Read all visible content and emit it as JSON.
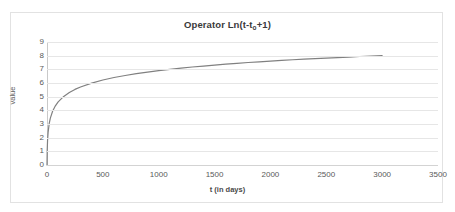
{
  "chart_data": {
    "type": "line",
    "title": "Operator  Ln(t-t",
    "title_sub": "o",
    "title_tail": "+1)",
    "title_full": "Operator  Ln(t-to+1)",
    "xlabel": "t (in days)",
    "ylabel": "value",
    "xlim": [
      0,
      3500
    ],
    "ylim": [
      0,
      9
    ],
    "xticks": [
      0,
      500,
      1000,
      1500,
      2000,
      2500,
      3000,
      3500
    ],
    "xtick_labels": [
      "0",
      "500",
      "1000",
      "1500",
      "2000",
      "2500",
      "3000",
      "3500"
    ],
    "yticks": [
      0,
      1,
      2,
      3,
      4,
      5,
      6,
      7,
      8,
      9
    ],
    "ytick_labels": [
      "0",
      "1",
      "2",
      "3",
      "4",
      "5",
      "6",
      "7",
      "8",
      "9"
    ],
    "grid": true,
    "grid_axis": "y",
    "legend": false,
    "series": [
      {
        "name": "Ln(t-to+1)",
        "color": "#808080",
        "line_width": 1.2,
        "x": [
          0,
          2,
          5,
          10,
          20,
          30,
          50,
          75,
          100,
          150,
          200,
          250,
          300,
          400,
          500,
          600,
          700,
          800,
          900,
          1000,
          1100,
          1200,
          1300,
          1400,
          1500,
          1600,
          1700,
          1800,
          1900,
          2000,
          2100,
          2200,
          2300,
          2400,
          2500,
          2600,
          2700,
          2800,
          2900,
          3000
        ],
        "y": [
          0.0,
          1.1,
          1.79,
          2.4,
          3.04,
          3.43,
          3.93,
          4.33,
          4.62,
          5.02,
          5.3,
          5.53,
          5.71,
          5.99,
          6.22,
          6.4,
          6.55,
          6.69,
          6.8,
          6.91,
          7.0,
          7.09,
          7.17,
          7.24,
          7.31,
          7.38,
          7.44,
          7.5,
          7.55,
          7.6,
          7.65,
          7.7,
          7.74,
          7.78,
          7.82,
          7.86,
          7.9,
          7.94,
          7.97,
          8.01
        ]
      }
    ]
  },
  "frame": {
    "border_color": "#e2e2e2",
    "background": "#ffffff"
  }
}
